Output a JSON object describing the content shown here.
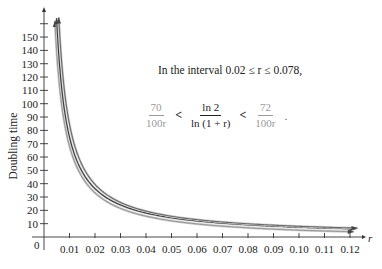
{
  "chart_data": {
    "type": "line",
    "title": "",
    "xlabel": "r",
    "ylabel": "Doubling time",
    "xlim": [
      0,
      0.12
    ],
    "ylim": [
      0,
      160
    ],
    "grid": false,
    "x_ticks": [
      "0.01",
      "0.02",
      "0.03",
      "0.04",
      "0.05",
      "0.06",
      "0.07",
      "0.08",
      "0.09",
      "0.10",
      "0.11",
      "0.12"
    ],
    "y_ticks": [
      "10",
      "20",
      "30",
      "40",
      "50",
      "60",
      "70",
      "80",
      "90",
      "100",
      "110",
      "120",
      "130",
      "140",
      "150"
    ],
    "origin_label": "0",
    "series": [
      {
        "name": "70/(100r)",
        "formula": "70/(100*r)",
        "color": "#9a9a9a",
        "x": [
          0.005,
          0.01,
          0.02,
          0.03,
          0.04,
          0.05,
          0.06,
          0.07,
          0.08,
          0.09,
          0.1,
          0.11,
          0.12
        ],
        "values": [
          140,
          70,
          35,
          23.3,
          17.5,
          14,
          11.7,
          10,
          8.75,
          7.78,
          7,
          6.36,
          5.83
        ]
      },
      {
        "name": "ln 2 / ln(1 + r)",
        "formula": "ln(2)/ln(1+r)",
        "color": "#3a3a3a",
        "x": [
          0.005,
          0.01,
          0.02,
          0.03,
          0.04,
          0.05,
          0.06,
          0.07,
          0.08,
          0.09,
          0.1,
          0.11,
          0.12
        ],
        "values": [
          139,
          69.7,
          35,
          23.4,
          17.7,
          14.2,
          11.9,
          10.2,
          9.0,
          8.04,
          7.27,
          6.64,
          6.12
        ]
      },
      {
        "name": "72/(100r)",
        "formula": "72/(100*r)",
        "color": "#6a6a6a",
        "x": [
          0.005,
          0.01,
          0.02,
          0.03,
          0.04,
          0.05,
          0.06,
          0.07,
          0.08,
          0.09,
          0.1,
          0.11,
          0.12
        ],
        "values": [
          144,
          72,
          36,
          24,
          18,
          14.4,
          12,
          10.3,
          9,
          8,
          7.2,
          6.55,
          6
        ]
      }
    ],
    "annotations": [
      "In the interval 0.02 ≤ r ≤ 0.078,",
      "70/(100r) < ln 2 / ln(1 + r) < 72/(100r)."
    ]
  },
  "annotation": {
    "interval_text": "In the interval 0.02 ≤ r ≤ 0.078,",
    "left_num": "70",
    "left_den": "100r",
    "lt1": "<",
    "mid_num": "ln 2",
    "mid_den": "ln (1 + r)",
    "lt2": "<",
    "right_num": "72",
    "right_den": "100r",
    "end": "."
  }
}
